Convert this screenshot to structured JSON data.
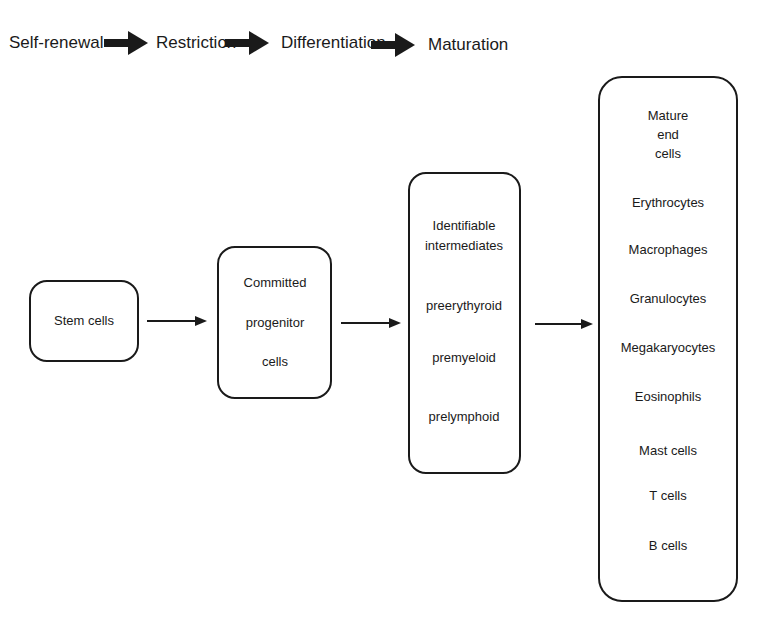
{
  "stages": [
    "Self-renewal",
    "Restriction",
    "Differentiation",
    "Maturation"
  ],
  "boxes": {
    "stem": {
      "label": "Stem cells"
    },
    "progenitor": {
      "lines": [
        "Committed",
        "progenitor",
        "cells"
      ]
    },
    "intermediates": {
      "title_lines": [
        "Identifiable",
        "intermediates"
      ],
      "items": [
        "preerythyroid",
        "premyeloid",
        "prelymphoid"
      ]
    },
    "mature": {
      "title_lines": [
        "Mature",
        "end",
        "cells"
      ],
      "items": [
        "Erythrocytes",
        "Macrophages",
        "Granulocytes",
        "Megakaryocytes",
        "Eosinophils",
        "Mast cells",
        "T cells",
        "B cells"
      ]
    }
  },
  "colors": {
    "stroke": "#1a1a1a",
    "background": "#ffffff"
  }
}
